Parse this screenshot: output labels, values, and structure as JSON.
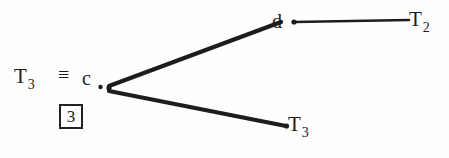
{
  "figure": {
    "background_color": "#fefefe",
    "ink_color": "#1d1d1d"
  },
  "root": {
    "label_base": "T",
    "label_sub": "3",
    "equivalence_symbol": "≡",
    "node_letter": "c",
    "index_box_value": "3"
  },
  "nodes": {
    "branch_letter": "d"
  },
  "leaves": [
    {
      "base": "T",
      "sub": "2"
    },
    {
      "base": "T",
      "sub": "3"
    }
  ],
  "edges": {
    "upper_branch": "diagonal-edge-root-to-d",
    "horizontal_branch": "horizontal-edge-d-to-t2",
    "lower_branch": "diagonal-edge-root-to-t3"
  }
}
